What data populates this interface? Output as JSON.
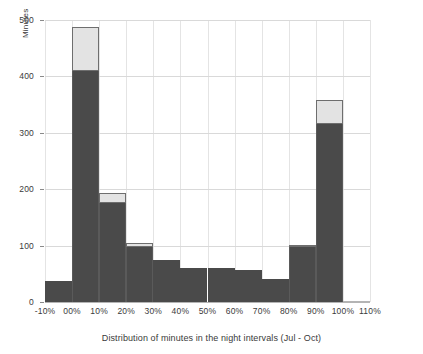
{
  "chart_data": {
    "type": "bar",
    "title": "",
    "xlabel": "Distribution of minutes in the night intervals (Jul - Oct)",
    "ylabel": "Minutes",
    "categories": [
      "-10%",
      "00%",
      "10%",
      "20%",
      "30%",
      "40%",
      "50%",
      "60%",
      "70%",
      "80%",
      "90%",
      "100%"
    ],
    "xtick_labels": [
      "-10%",
      "00%",
      "10%",
      "20%",
      "30%",
      "40%",
      "50%",
      "60%",
      "70%",
      "80%",
      "90%",
      "100%",
      "110%"
    ],
    "ytick_labels": [
      "0",
      "100",
      "200",
      "300",
      "400",
      "500"
    ],
    "ytick_values": [
      0,
      100,
      200,
      300,
      400,
      500
    ],
    "ylim": [
      0,
      500
    ],
    "grid": true,
    "legend": "none",
    "stacked": true,
    "series": [
      {
        "name": "dark",
        "color": "#4a4a4a",
        "values": [
          38,
          410,
          176,
          97,
          75,
          60,
          61,
          56,
          41,
          98,
          315,
          0
        ]
      },
      {
        "name": "light",
        "color": "#e3e3e3",
        "values": [
          0,
          78,
          17,
          7,
          0,
          0,
          0,
          0,
          0,
          2,
          43,
          0
        ]
      }
    ],
    "totals": [
      38,
      488,
      193,
      104,
      75,
      60,
      61,
      56,
      41,
      100,
      358,
      0
    ]
  },
  "colors": {
    "bar_dark": "#4a4a4a",
    "bar_light": "#e3e3e3",
    "bar_light_border": "#6e6e6e",
    "gridline": "#d9d9d9",
    "vgridline": "#e4e4e4",
    "axis": "#b4b4b4",
    "text": "#3a3a3a",
    "background": "#ffffff"
  }
}
